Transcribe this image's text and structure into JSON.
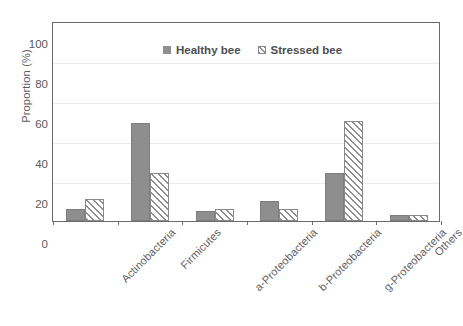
{
  "chart_data": {
    "type": "bar",
    "title": "",
    "xlabel": "",
    "ylabel": "Proportion (%)",
    "ylim": [
      0,
      100
    ],
    "ytick_labels": [
      "0",
      "20",
      "40",
      "60",
      "80",
      "100"
    ],
    "ytick_values": [
      0,
      20,
      40,
      60,
      80,
      100
    ],
    "grid": true,
    "legend_position": "top-center",
    "categories": [
      "Actinobacteria",
      "Firmicutes",
      "a-Proteobacteria",
      "b-Proteobacteria",
      "g-Proteobacteria",
      "Others"
    ],
    "series": [
      {
        "name": "Healthy bee",
        "color": "#8e8e8e",
        "fill": "solid",
        "values": [
          6,
          49,
          5,
          10,
          24,
          3
        ]
      },
      {
        "name": "Stressed bee",
        "color": "#8e8e8e",
        "fill": "diagonal-hatch",
        "values": [
          11,
          24,
          6,
          6,
          50,
          3
        ]
      }
    ]
  },
  "legend": {
    "items": [
      {
        "label": "Healthy bee",
        "swatch": "solid-gray-square"
      },
      {
        "label": "Stressed bee",
        "swatch": "hatched-square"
      }
    ]
  },
  "colors": {
    "bar_fill": "#8e8e8e",
    "axis": "#6b6b6b",
    "gridline": "#eceaea",
    "text": "#5a5a5a",
    "background": "#ffffff"
  }
}
